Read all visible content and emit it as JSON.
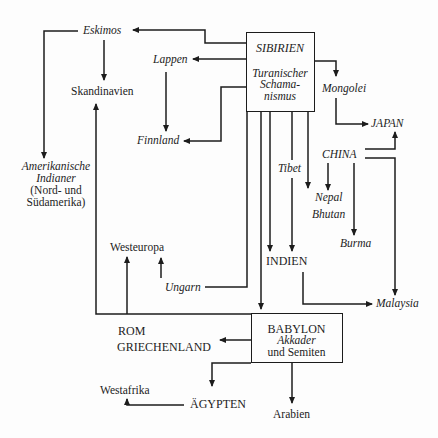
{
  "diagram": {
    "nodes": {
      "sibirien": {
        "title": "SIBIRIEN",
        "line1": "Turanischer",
        "line2": "Schama-",
        "line3": "nismus"
      },
      "babylon": {
        "title": "BABYLON",
        "line1": "Akkader",
        "line2": "und Semiten"
      },
      "eskimos": "Eskimos",
      "lappen": "Lappen",
      "skandinavien": "Skandinavien",
      "finnland": "Finnland",
      "amerikanische": {
        "line1": "Amerikanische",
        "line2": "Indianer",
        "line3": "(Nord- und",
        "line4": "Südamerika)"
      },
      "mongolei": "Mongolei",
      "japan": "JAPAN",
      "china": "CHINA",
      "tibet": "Tibet",
      "nepal": "Nepal",
      "bhutan": "Bhutan",
      "burma": "Burma",
      "indien": "INDIEN",
      "malaysia": "Malaysia",
      "westeuropa": "Westeuropa",
      "ungarn": "Ungarn",
      "rom": "ROM",
      "griechenland": "GRIECHENLAND",
      "westafrika": "Westafrika",
      "aegypten": "ÄGYPTEN",
      "arabien": "Arabien"
    },
    "edges": [
      {
        "from": "SIBIRIEN",
        "to": "Eskimos"
      },
      {
        "from": "SIBIRIEN",
        "to": "Lappen"
      },
      {
        "from": "SIBIRIEN",
        "to": "Finnland"
      },
      {
        "from": "SIBIRIEN",
        "to": "Mongolei"
      },
      {
        "from": "Mongolei",
        "to": "JAPAN"
      },
      {
        "from": "CHINA",
        "to": "JAPAN"
      },
      {
        "from": "CHINA",
        "to": "Nepal Bhutan"
      },
      {
        "from": "CHINA",
        "to": "Burma"
      },
      {
        "from": "CHINA",
        "to": "Malaysia"
      },
      {
        "from": "SIBIRIEN",
        "to": "Nepal Bhutan"
      },
      {
        "from": "SIBIRIEN",
        "to": "INDIEN"
      },
      {
        "from": "Tibet",
        "to": "INDIEN"
      },
      {
        "from": "SIBIRIEN",
        "to": "BABYLON"
      },
      {
        "from": "SIBIRIEN",
        "to": "Ungarn"
      },
      {
        "from": "Ungarn",
        "to": "Westeuropa"
      },
      {
        "from": "INDIEN",
        "to": "Malaysia"
      },
      {
        "from": "Eskimos",
        "to": "Skandinavien"
      },
      {
        "from": "Eskimos",
        "to": "Amerikanische Indianer"
      },
      {
        "from": "Lappen",
        "to": "Finnland"
      },
      {
        "from": "BABYLON",
        "to": "Skandinavien"
      },
      {
        "from": "BABYLON",
        "to": "Westeuropa"
      },
      {
        "from": "BABYLON",
        "to": "ROM GRIECHENLAND"
      },
      {
        "from": "BABYLON",
        "to": "ÄGYPTEN"
      },
      {
        "from": "BABYLON",
        "to": "Arabien"
      },
      {
        "from": "ÄGYPTEN",
        "to": "Westafrika"
      }
    ]
  }
}
